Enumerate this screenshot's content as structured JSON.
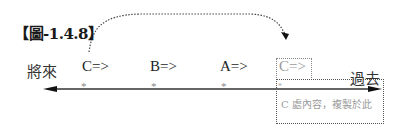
{
  "figure": {
    "title": "【圖-1.4.8】",
    "left_label": "將來",
    "right_label": "過去",
    "markers": [
      {
        "label": "C=>",
        "x": 82
      },
      {
        "label": "B=>",
        "x": 150
      },
      {
        "label": "A=>",
        "x": 220
      },
      {
        "label": "C=>",
        "x": 279,
        "faded": true
      }
    ],
    "copy_box_text": "C 處內容，複製於此",
    "arrow_description": "dotted curved arrow from first C=> to copied C=>",
    "timeline_arrows": "double-headed arrow",
    "colors": {
      "line": "#333333",
      "faded_text": "#9a9a9a",
      "dotted": "#555555"
    }
  }
}
